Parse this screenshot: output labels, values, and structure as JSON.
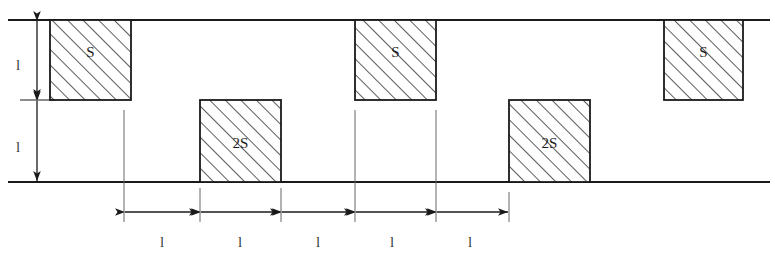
{
  "diagram": {
    "colors": {
      "background": "#ffffff",
      "line": "#1a1a1a",
      "hatch": "#333333",
      "dimension": "#555555",
      "text": "#1a1a1a"
    },
    "reference_lines": {
      "top_line_y": 20,
      "base_line_y": 182,
      "x_start": 8,
      "x_end": 770
    },
    "upper_blocks": [
      {
        "label": "S",
        "x": 50,
        "y": 20,
        "width": 81,
        "height": 80
      },
      {
        "label": "S",
        "x": 355,
        "y": 20,
        "width": 81,
        "height": 80
      },
      {
        "label": "S",
        "x": 664,
        "y": 20,
        "width": 79,
        "height": 80
      }
    ],
    "lower_blocks": [
      {
        "label": "2S",
        "x": 200,
        "y": 100,
        "width": 81,
        "height": 82
      },
      {
        "label": "2S",
        "x": 509,
        "y": 100,
        "width": 81,
        "height": 82
      }
    ],
    "vertical_dimensions": [
      {
        "label": "l",
        "x": 37,
        "y_top": 20,
        "y_bottom": 100,
        "label_x": 18,
        "label_y": 65
      },
      {
        "label": "l",
        "x": 37,
        "y_top": 100,
        "y_bottom": 182,
        "label_x": 18,
        "label_y": 147
      }
    ],
    "horizontal_dimensions": [
      {
        "label": "l",
        "x_start": 124,
        "x_end": 200,
        "label_x": 162
      },
      {
        "label": "l",
        "x_start": 200,
        "x_end": 281,
        "label_x": 240
      },
      {
        "label": "l",
        "x_start": 281,
        "x_end": 355,
        "label_x": 318
      },
      {
        "label": "l",
        "x_start": 355,
        "x_end": 436,
        "label_x": 392
      },
      {
        "label": "l",
        "x_start": 436,
        "x_end": 509,
        "label_x": 470
      }
    ],
    "dimension_line_y": 212,
    "dimension_label_y": 242,
    "extension_lines": [
      {
        "x": 124,
        "y_top": 110,
        "y_bottom": 222
      },
      {
        "x": 200,
        "y_top": 188,
        "y_bottom": 222
      },
      {
        "x": 281,
        "y_top": 188,
        "y_bottom": 222
      },
      {
        "x": 355,
        "y_top": 110,
        "y_bottom": 222
      },
      {
        "x": 436,
        "y_top": 110,
        "y_bottom": 222
      },
      {
        "x": 509,
        "y_top": 192,
        "y_bottom": 222
      }
    ]
  }
}
